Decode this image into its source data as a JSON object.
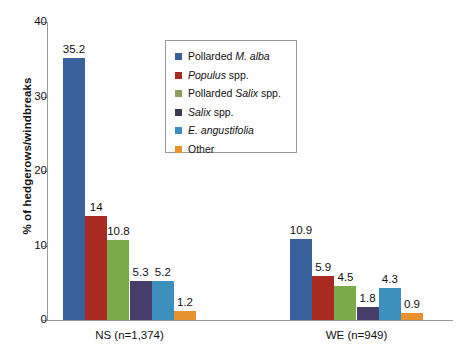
{
  "chart_data": {
    "type": "bar",
    "title": "",
    "xlabel": "",
    "ylabel": "% of hedgerows/windbreaks",
    "ylim": [
      0,
      40
    ],
    "yticks": [
      0,
      10,
      20,
      30,
      40
    ],
    "grid": false,
    "legend_position": "top-center",
    "categories": [
      "NS (n=1,374)",
      "WE (n=949)"
    ],
    "series": [
      {
        "name": "Pollarded M. alba",
        "color": "#39619b",
        "values": [
          35.2,
          10.9
        ]
      },
      {
        "name": "Populus spp.",
        "color": "#a82a20",
        "values": [
          14,
          5.9
        ]
      },
      {
        "name": "Pollarded Salix spp.",
        "color": "#7bab49",
        "values": [
          10.8,
          4.5
        ]
      },
      {
        "name": "Salix spp.",
        "color": "#483d68",
        "values": [
          5.3,
          1.8
        ]
      },
      {
        "name": "E. angustifolia",
        "color": "#3d90bd",
        "values": [
          5.2,
          4.3
        ]
      },
      {
        "name": "Other",
        "color": "#e8922e",
        "values": [
          1.2,
          0.9
        ]
      }
    ],
    "value_labels": {
      "NS (n=1,374)": [
        "35.2",
        "14",
        "10.8",
        "5.3",
        "5.2",
        "1.2"
      ],
      "WE (n=949)": [
        "10.9",
        "5.9",
        "4.5",
        "1.8",
        "4.3",
        "0.9"
      ]
    }
  },
  "axis": {
    "y_title": "% of hedgerows/windbreaks",
    "ticks": [
      "40",
      "30",
      "20",
      "10",
      "0"
    ]
  },
  "groups": [
    {
      "label": "NS (n=1,374)"
    },
    {
      "label": "WE (n=949)"
    }
  ],
  "legend": {
    "items": [
      {
        "label_pre": "Pollarded ",
        "label_it": "M. alba",
        "label_post": "",
        "swatch": "#39619b"
      },
      {
        "label_pre": "",
        "label_it": "Populus",
        "label_post": " spp.",
        "swatch": "#a82a20"
      },
      {
        "label_pre": "Pollarded ",
        "label_it": "Salix",
        "label_post": " spp.",
        "swatch": "#8aa05a"
      },
      {
        "label_pre": "",
        "label_it": "Salix",
        "label_post": " spp.",
        "swatch": "#3b3b55"
      },
      {
        "label_pre": "",
        "label_it": "E. angustifolia",
        "label_post": "",
        "swatch": "#3d90bd"
      },
      {
        "label_pre": "Other",
        "label_it": "",
        "label_post": "",
        "swatch": "#e8922e"
      }
    ]
  }
}
